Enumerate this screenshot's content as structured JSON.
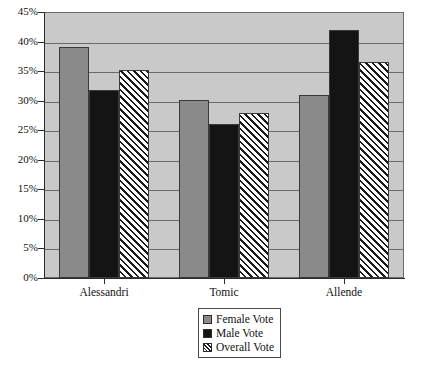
{
  "chart_data": {
    "type": "bar",
    "title": "",
    "subtitle": "",
    "xlabel": "",
    "ylabel": "",
    "categories": [
      "Alessandri",
      "Tomic",
      "Allende"
    ],
    "series": [
      {
        "name": "Female Vote",
        "values": [
          39.0,
          30.1,
          31.0
        ],
        "color": "#8a8a8a",
        "fill": "solid-gray"
      },
      {
        "name": "Male Vote",
        "values": [
          31.8,
          26.1,
          42.0
        ],
        "color": "#141414",
        "fill": "solid-black"
      },
      {
        "name": "Overall Vote",
        "values": [
          35.2,
          27.9,
          36.5
        ],
        "color": "#ffffff",
        "fill": "diagonal-hatch"
      }
    ],
    "ylim": [
      0,
      45
    ],
    "ytick_values": [
      0,
      5,
      10,
      15,
      20,
      25,
      30,
      35,
      40,
      45
    ],
    "ytick_labels": [
      "0%",
      "5%",
      "10%",
      "15%",
      "20%",
      "25%",
      "30%",
      "35%",
      "40%",
      "45%"
    ],
    "grid": true,
    "grid_axis": "y",
    "legend_position": "bottom-center",
    "plot_background": "#c9c9c9",
    "figure_background": "#ffffff"
  },
  "axes": {
    "y": {
      "ticks": [
        {
          "label": "45%",
          "value": 45
        },
        {
          "label": "40%",
          "value": 40
        },
        {
          "label": "35%",
          "value": 35
        },
        {
          "label": "30%",
          "value": 30
        },
        {
          "label": "25%",
          "value": 25
        },
        {
          "label": "20%",
          "value": 20
        },
        {
          "label": "15%",
          "value": 15
        },
        {
          "label": "10%",
          "value": 10
        },
        {
          "label": "5%",
          "value": 5
        },
        {
          "label": "0%",
          "value": 0
        }
      ]
    },
    "x": {
      "ticks": [
        {
          "label": "Alessandri"
        },
        {
          "label": "Tomic"
        },
        {
          "label": "Allende"
        }
      ]
    }
  },
  "legend": {
    "items": [
      {
        "label": "Female Vote",
        "swatch": "solid-gray-swatch"
      },
      {
        "label": "Male Vote",
        "swatch": "solid-black-swatch"
      },
      {
        "label": "Overall Vote",
        "swatch": "hatched-swatch"
      }
    ]
  }
}
